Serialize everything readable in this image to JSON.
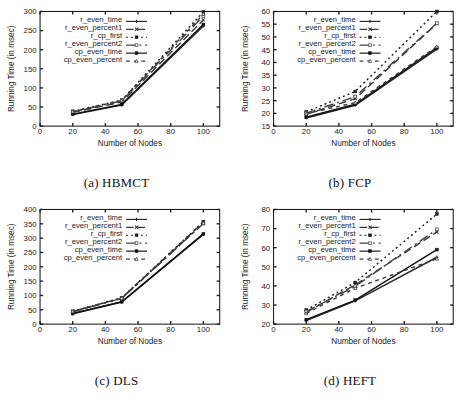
{
  "figure": {
    "panel_captions": [
      "(a) HBMCT",
      "(b) FCP",
      "(c) DLS",
      "(d) HEFT"
    ]
  },
  "axes_labels": {
    "x": "Number of Nodes",
    "y": "Running Time (in msec)"
  },
  "legend_entries": [
    "r_even_time",
    "r_even_percent1",
    "r_cp_first",
    "r_even_percent2",
    "cp_even_time",
    "cp_even_percent"
  ],
  "series_styles": [
    {
      "name": "r_even_time",
      "dash": "none",
      "marker": "plus",
      "color": "#2b2b2b"
    },
    {
      "name": "r_even_percent1",
      "dash": "4 2",
      "marker": "cross",
      "color": "#3a3a3a"
    },
    {
      "name": "r_cp_first",
      "dash": "1 1.6",
      "marker": "square",
      "color": "#1a1a1a"
    },
    {
      "name": "r_even_percent2",
      "dash": "5 2 1 2",
      "marker": "osquare",
      "color": "#444444"
    },
    {
      "name": "cp_even_time",
      "dash": "none",
      "marker": "fsquare",
      "color": "#111111"
    },
    {
      "name": "cp_even_percent",
      "dash": "2 2",
      "marker": "tri",
      "color": "#3a3a3a"
    }
  ],
  "chart_data": [
    {
      "type": "line",
      "title": "(a) HBMCT",
      "xlabel": "Number of Nodes",
      "ylabel": "Running Time (in msec)",
      "x": [
        20,
        50,
        100
      ],
      "xlim": [
        0,
        110
      ],
      "ylim": [
        0,
        300
      ],
      "xticks": [
        0,
        20,
        40,
        60,
        80,
        100
      ],
      "yticks": [
        0,
        50,
        100,
        150,
        200,
        250,
        300
      ],
      "grid": false,
      "legend_position": "top-left",
      "series": [
        {
          "name": "r_even_time",
          "values": [
            30,
            55,
            262
          ]
        },
        {
          "name": "r_even_percent1",
          "values": [
            36,
            63,
            278
          ]
        },
        {
          "name": "r_cp_first",
          "values": [
            39,
            68,
            299
          ]
        },
        {
          "name": "r_even_percent2",
          "values": [
            37,
            66,
            288
          ]
        },
        {
          "name": "cp_even_time",
          "values": [
            31,
            57,
            266
          ]
        },
        {
          "name": "cp_even_percent",
          "values": [
            38,
            67,
            293
          ]
        }
      ]
    },
    {
      "type": "line",
      "title": "(b) FCP",
      "xlabel": "Number of Nodes",
      "ylabel": "Running Time (in msec)",
      "x": [
        20,
        50,
        100
      ],
      "xlim": [
        0,
        110
      ],
      "ylim": [
        15,
        60
      ],
      "xticks": [
        0,
        20,
        40,
        60,
        80,
        100
      ],
      "yticks": [
        15,
        20,
        25,
        30,
        35,
        40,
        45,
        50,
        55,
        60
      ],
      "grid": false,
      "legend_position": "top-left",
      "series": [
        {
          "name": "r_even_time",
          "values": [
            18.2,
            23.2,
            45.2
          ]
        },
        {
          "name": "r_even_percent1",
          "values": [
            19.6,
            25.8,
            55.2
          ]
        },
        {
          "name": "r_cp_first",
          "values": [
            20.6,
            28.6,
            60.0
          ]
        },
        {
          "name": "r_even_percent2",
          "values": [
            20.1,
            26.6,
            55.4
          ]
        },
        {
          "name": "cp_even_time",
          "values": [
            18.5,
            23.6,
            45.8
          ]
        },
        {
          "name": "cp_even_percent",
          "values": [
            19.9,
            24.2,
            46.2
          ]
        }
      ]
    },
    {
      "type": "line",
      "title": "(c) DLS",
      "xlabel": "Number of Nodes",
      "ylabel": "Running Time (in msec)",
      "x": [
        20,
        50,
        100
      ],
      "xlim": [
        0,
        110
      ],
      "ylim": [
        0,
        400
      ],
      "xticks": [
        0,
        20,
        40,
        60,
        80,
        100
      ],
      "yticks": [
        0,
        50,
        100,
        150,
        200,
        250,
        300,
        350,
        400
      ],
      "grid": false,
      "legend_position": "top-left",
      "series": [
        {
          "name": "r_even_time",
          "values": [
            36,
            77,
            313
          ]
        },
        {
          "name": "r_even_percent1",
          "values": [
            44,
            91,
            356
          ]
        },
        {
          "name": "r_cp_first",
          "values": [
            45,
            92,
            357
          ]
        },
        {
          "name": "r_even_percent2",
          "values": [
            43,
            90,
            351
          ]
        },
        {
          "name": "cp_even_time",
          "values": [
            37,
            78,
            315
          ]
        },
        {
          "name": "cp_even_percent",
          "values": [
            44,
            90,
            352
          ]
        }
      ]
    },
    {
      "type": "line",
      "title": "(d) HEFT",
      "xlabel": "Number of Nodes",
      "ylabel": "Running Time (in msec)",
      "x": [
        20,
        50,
        100
      ],
      "xlim": [
        0,
        110
      ],
      "ylim": [
        20,
        80
      ],
      "xticks": [
        0,
        20,
        40,
        60,
        80,
        100
      ],
      "yticks": [
        20,
        30,
        40,
        50,
        60,
        70,
        80
      ],
      "grid": false,
      "legend_position": "top-left",
      "series": [
        {
          "name": "r_even_time",
          "values": [
            21.8,
            32.2,
            55.0
          ]
        },
        {
          "name": "r_even_percent1",
          "values": [
            26.2,
            40.6,
            68.2
          ]
        },
        {
          "name": "r_cp_first",
          "values": [
            27.4,
            41.8,
            77.6
          ]
        },
        {
          "name": "r_even_percent2",
          "values": [
            26.6,
            39.8,
            69.6
          ]
        },
        {
          "name": "cp_even_time",
          "values": [
            22.4,
            32.6,
            59.0
          ]
        },
        {
          "name": "cp_even_percent",
          "values": [
            25.6,
            38.8,
            54.2
          ]
        }
      ]
    }
  ]
}
